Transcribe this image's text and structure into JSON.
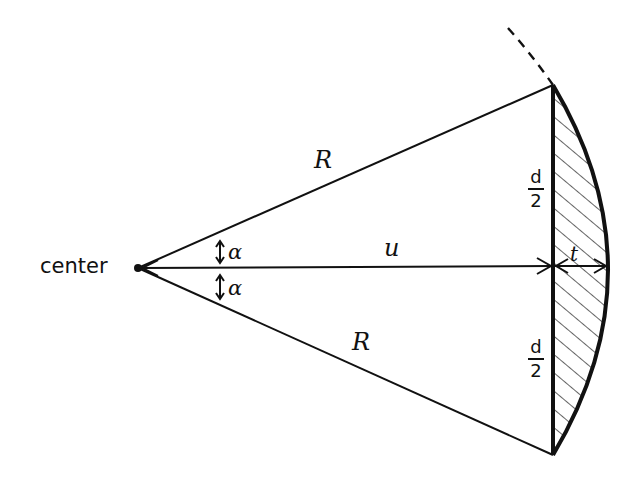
{
  "diagram": {
    "type": "geometry-circular-segment",
    "colors": {
      "ink": "#111111",
      "background": "#ffffff"
    },
    "labels": {
      "center": "center",
      "radius_top": "R",
      "radius_bottom": "R",
      "apothem": "u",
      "sagitta": "t",
      "angle_top": "α",
      "angle_bottom": "α",
      "half_chord_top": {
        "numerator": "d",
        "denominator": "2"
      },
      "half_chord_bottom": {
        "numerator": "d",
        "denominator": "2"
      }
    }
  }
}
